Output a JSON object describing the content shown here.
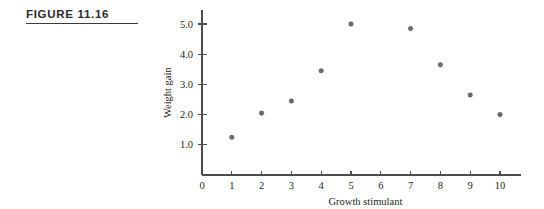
{
  "figure": {
    "label": "FIGURE 11.16"
  },
  "chart_data": {
    "type": "scatter",
    "title": "",
    "xlabel": "Growth stimulant",
    "ylabel": "Weight gain",
    "xlim": [
      0,
      10.7
    ],
    "ylim": [
      0,
      5.45
    ],
    "grid": false,
    "legend": null,
    "xticks": [
      0,
      1,
      2,
      3,
      4,
      5,
      6,
      7,
      8,
      9,
      10
    ],
    "xtick_labels": [
      "0",
      "1",
      "2",
      "3",
      "4",
      "5",
      "6",
      "7",
      "8",
      "9",
      "10"
    ],
    "yticks": [
      1.0,
      2.0,
      3.0,
      4.0,
      5.0
    ],
    "ytick_labels": [
      "1.0",
      "2.0",
      "3.0",
      "4.0",
      "5.0"
    ],
    "series": [
      {
        "name": "observations",
        "marker": "circle",
        "color": "#6b6b6b",
        "x": [
          1,
          2,
          3,
          4,
          5,
          7,
          8,
          9,
          10
        ],
        "y": [
          1.25,
          2.05,
          2.45,
          3.45,
          5.0,
          4.85,
          3.65,
          2.65,
          2.0
        ]
      }
    ]
  }
}
